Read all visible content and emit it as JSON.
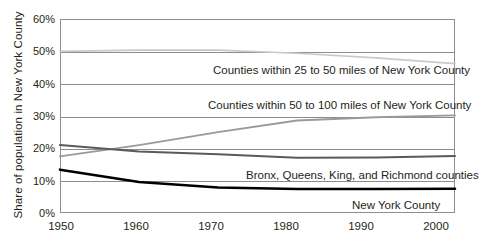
{
  "chart_data": {
    "type": "line",
    "title": "",
    "xlabel": "",
    "ylabel": "Share of population in New York County",
    "x": [
      1950,
      1960,
      1970,
      1980,
      1990,
      2000
    ],
    "xtick_labels": [
      "1950",
      "1960",
      "1970",
      "1980",
      "1990",
      "2000"
    ],
    "ytick_labels": [
      "0%",
      "10%",
      "20%",
      "30%",
      "40%",
      "50%",
      "60%"
    ],
    "ytick_values": [
      0,
      10,
      20,
      30,
      40,
      50,
      60
    ],
    "ylim": [
      0,
      60
    ],
    "xlim": [
      1947,
      2002
    ],
    "grid": "horizontal",
    "legend_position": "inline-annotations",
    "series": [
      {
        "name": "Counties within 25 to 50 miles of New York County",
        "color": "#c9c9c9",
        "values": [
          50.0,
          50.4,
          50.4,
          49.4,
          48.0,
          46.2
        ]
      },
      {
        "name": "Counties within 50 to 100 miles of New York County",
        "color": "#9a9a9a",
        "values": [
          17.5,
          21.0,
          25.0,
          28.6,
          29.6,
          30.2
        ]
      },
      {
        "name": "Bronx, Queens, King, and Richmond counties",
        "color": "#5a5a5a",
        "values": [
          21.0,
          19.0,
          18.2,
          17.1,
          17.2,
          17.6
        ]
      },
      {
        "name": "New York County",
        "color": "#000000",
        "values": [
          13.4,
          9.6,
          7.9,
          7.4,
          7.4,
          7.5
        ]
      }
    ],
    "annotations": [
      {
        "text": "Counties within 25 to 50 miles of New York County",
        "series": 0
      },
      {
        "text": "Counties within 50 to 100 miles of New York County",
        "series": 1
      },
      {
        "text": "Bronx, Queens, King, and Richmond counties",
        "series": 2
      },
      {
        "text": "New York County",
        "series": 3
      }
    ]
  }
}
